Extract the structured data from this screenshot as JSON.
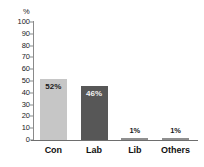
{
  "chart_data": {
    "type": "bar",
    "title": "",
    "xlabel": "",
    "ylabel": "%",
    "ylim": [
      0,
      100
    ],
    "grid": false,
    "legend": false,
    "categories": [
      "Con",
      "Lab",
      "Lib",
      "Others"
    ],
    "values": [
      52,
      46,
      1,
      1
    ],
    "data_labels": [
      "52%",
      "46%",
      "1%",
      "1%"
    ],
    "yticks": [
      0,
      10,
      20,
      30,
      40,
      50,
      60,
      70,
      80,
      90,
      100
    ],
    "ytick_labels": [
      "0",
      "10",
      "20",
      "30",
      "40",
      "50",
      "60",
      "70",
      "80",
      "90",
      "100"
    ],
    "bar_colors": [
      "#c6c6c6",
      "#575757",
      "#8f8f8f",
      "#8f8f8f"
    ],
    "axis_color": "#7a7a7a",
    "background": "#ffffff",
    "series": [
      {
        "name": "Vote share",
        "values": [
          52,
          46,
          1,
          1
        ]
      }
    ]
  },
  "axis": {
    "unit_label": "%"
  }
}
